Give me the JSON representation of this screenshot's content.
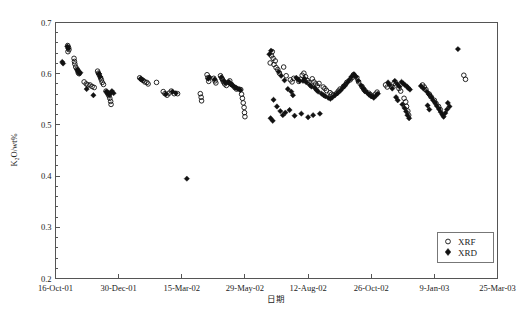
{
  "chart_data": {
    "type": "scatter",
    "title": "",
    "xlabel": "日期",
    "ylabel": "K₂O/wt%",
    "ylim": [
      0.2,
      0.7
    ],
    "yticks": [
      0.2,
      0.3,
      0.4,
      0.5,
      0.6,
      0.7
    ],
    "ytick_labels": [
      "0.2",
      "0.3",
      "0.4",
      "0.5",
      "0.6",
      "0.7"
    ],
    "y_minor_tick_step": 0.02,
    "xlim": [
      0,
      525
    ],
    "xtick_positions": [
      0,
      75,
      150,
      225,
      300,
      375,
      450,
      525
    ],
    "xtick_labels": [
      "16-Oct-01",
      "30-Dec-01",
      "15-Mar-02",
      "29-May-02",
      "12-Aug-02",
      "26-Oct-02",
      "9-Jan-03",
      "25-Mar-03"
    ],
    "grid": false,
    "legend_position": "lower-right",
    "marker_colors": {
      "xrf": "#111111",
      "xrd": "#111111"
    },
    "series": [
      {
        "name": "XRF",
        "marker": "open-circle",
        "points": [
          [
            14.5,
            0.655
          ],
          [
            15.5,
            0.651
          ],
          [
            16.0,
            0.647
          ],
          [
            14.8,
            0.643
          ],
          [
            22.0,
            0.63
          ],
          [
            22.5,
            0.624
          ],
          [
            23.0,
            0.619
          ],
          [
            24.0,
            0.613
          ],
          [
            25.5,
            0.609
          ],
          [
            26.5,
            0.606
          ],
          [
            27.0,
            0.602
          ],
          [
            28.0,
            0.6
          ],
          [
            34.0,
            0.584
          ],
          [
            36.5,
            0.58
          ],
          [
            38.5,
            0.578
          ],
          [
            41.0,
            0.578
          ],
          [
            43.5,
            0.575
          ],
          [
            46.0,
            0.573
          ],
          [
            50.0,
            0.605
          ],
          [
            51.0,
            0.601
          ],
          [
            52.0,
            0.598
          ],
          [
            53.5,
            0.592
          ],
          [
            54.5,
            0.588
          ],
          [
            55.5,
            0.583
          ],
          [
            57.0,
            0.579
          ],
          [
            60.0,
            0.566
          ],
          [
            61.5,
            0.563
          ],
          [
            62.5,
            0.56
          ],
          [
            63.5,
            0.557
          ],
          [
            64.5,
            0.552
          ],
          [
            65.5,
            0.546
          ],
          [
            66.0,
            0.54
          ],
          [
            100.0,
            0.592
          ],
          [
            102.0,
            0.589
          ],
          [
            104.0,
            0.587
          ],
          [
            106.0,
            0.584
          ],
          [
            108.5,
            0.583
          ],
          [
            110.0,
            0.58
          ],
          [
            120.0,
            0.583
          ],
          [
            128.0,
            0.565
          ],
          [
            130.0,
            0.561
          ],
          [
            132.5,
            0.558
          ],
          [
            135.0,
            0.562
          ],
          [
            137.5,
            0.566
          ],
          [
            141.0,
            0.561
          ],
          [
            145.0,
            0.561
          ],
          [
            172.0,
            0.561
          ],
          [
            173.0,
            0.554
          ],
          [
            173.5,
            0.547
          ],
          [
            180.0,
            0.598
          ],
          [
            181.0,
            0.592
          ],
          [
            182.0,
            0.585
          ],
          [
            188.0,
            0.591
          ],
          [
            189.5,
            0.586
          ],
          [
            190.5,
            0.582
          ],
          [
            196.0,
            0.596
          ],
          [
            197.5,
            0.591
          ],
          [
            198.5,
            0.588
          ],
          [
            199.5,
            0.584
          ],
          [
            201.0,
            0.58
          ],
          [
            203.0,
            0.577
          ],
          [
            205.0,
            0.583
          ],
          [
            207.0,
            0.586
          ],
          [
            209.0,
            0.579
          ],
          [
            213.0,
            0.573
          ],
          [
            215.0,
            0.57
          ],
          [
            220.0,
            0.569
          ],
          [
            221.0,
            0.56
          ],
          [
            222.0,
            0.552
          ],
          [
            223.0,
            0.543
          ],
          [
            224.0,
            0.534
          ],
          [
            224.5,
            0.524
          ],
          [
            225.0,
            0.516
          ],
          [
            255.0,
            0.621
          ],
          [
            256.5,
            0.635
          ],
          [
            257.5,
            0.643
          ],
          [
            258.5,
            0.63
          ],
          [
            259.5,
            0.618
          ],
          [
            261.0,
            0.625
          ],
          [
            262.0,
            0.612
          ],
          [
            264.0,
            0.608
          ],
          [
            266.0,
            0.601
          ],
          [
            271.0,
            0.613
          ],
          [
            274.0,
            0.596
          ],
          [
            279.0,
            0.588
          ],
          [
            281.0,
            0.584
          ],
          [
            283.0,
            0.591
          ],
          [
            289.0,
            0.585
          ],
          [
            291.0,
            0.589
          ],
          [
            293.0,
            0.597
          ],
          [
            295.0,
            0.601
          ],
          [
            297.0,
            0.594
          ],
          [
            299.0,
            0.587
          ],
          [
            301.0,
            0.583
          ],
          [
            305.0,
            0.59
          ],
          [
            307.0,
            0.584
          ],
          [
            309.0,
            0.58
          ],
          [
            311.0,
            0.576
          ],
          [
            313.0,
            0.581
          ],
          [
            318.0,
            0.574
          ],
          [
            320.0,
            0.571
          ],
          [
            322.0,
            0.567
          ],
          [
            326.0,
            0.563
          ],
          [
            328.0,
            0.56
          ],
          [
            330.0,
            0.558
          ],
          [
            334.0,
            0.562
          ],
          [
            336.0,
            0.566
          ],
          [
            338.0,
            0.57
          ],
          [
            342.0,
            0.575
          ],
          [
            344.0,
            0.578
          ],
          [
            346.0,
            0.583
          ],
          [
            350.0,
            0.588
          ],
          [
            352.0,
            0.592
          ],
          [
            354.0,
            0.598
          ],
          [
            358.0,
            0.592
          ],
          [
            360.0,
            0.584
          ],
          [
            364.0,
            0.575
          ],
          [
            366.0,
            0.57
          ],
          [
            368.0,
            0.566
          ],
          [
            372.0,
            0.562
          ],
          [
            374.0,
            0.559
          ],
          [
            376.0,
            0.556
          ],
          [
            380.0,
            0.56
          ],
          [
            382.0,
            0.564
          ],
          [
            392.0,
            0.578
          ],
          [
            394.0,
            0.574
          ],
          [
            402.0,
            0.581
          ],
          [
            404.0,
            0.578
          ],
          [
            408.0,
            0.571
          ],
          [
            410.0,
            0.566
          ],
          [
            414.0,
            0.552
          ],
          [
            416.0,
            0.545
          ],
          [
            417.0,
            0.536
          ],
          [
            418.5,
            0.527
          ],
          [
            419.5,
            0.519
          ],
          [
            436.0,
            0.578
          ],
          [
            438.0,
            0.574
          ],
          [
            440.0,
            0.569
          ],
          [
            444.0,
            0.56
          ],
          [
            446.0,
            0.555
          ],
          [
            450.0,
            0.548
          ],
          [
            452.0,
            0.542
          ],
          [
            455.0,
            0.536
          ],
          [
            457.0,
            0.53
          ],
          [
            485.0,
            0.597
          ],
          [
            487.0,
            0.589
          ]
        ]
      },
      {
        "name": "XRD",
        "marker": "filled-diamond",
        "points": [
          [
            14.0,
            0.653
          ],
          [
            15.0,
            0.649
          ],
          [
            8.0,
            0.623
          ],
          [
            9.0,
            0.62
          ],
          [
            26.0,
            0.608
          ],
          [
            27.5,
            0.604
          ],
          [
            28.5,
            0.601
          ],
          [
            29.5,
            0.602
          ],
          [
            37.0,
            0.57
          ],
          [
            51.5,
            0.6
          ],
          [
            53.0,
            0.594
          ],
          [
            60.5,
            0.565
          ],
          [
            62.0,
            0.562
          ],
          [
            64.0,
            0.559
          ],
          [
            65.0,
            0.562
          ],
          [
            67.0,
            0.566
          ],
          [
            69.0,
            0.562
          ],
          [
            45.0,
            0.558
          ],
          [
            101.0,
            0.59
          ],
          [
            103.0,
            0.588
          ],
          [
            131.0,
            0.56
          ],
          [
            139.0,
            0.565
          ],
          [
            143.0,
            0.562
          ],
          [
            156.0,
            0.395
          ],
          [
            181.5,
            0.59
          ],
          [
            183.0,
            0.593
          ],
          [
            189.0,
            0.589
          ],
          [
            197.0,
            0.593
          ],
          [
            200.0,
            0.586
          ],
          [
            202.0,
            0.582
          ],
          [
            206.0,
            0.584
          ],
          [
            208.0,
            0.58
          ],
          [
            210.0,
            0.577
          ],
          [
            212.0,
            0.575
          ],
          [
            214.0,
            0.573
          ],
          [
            216.0,
            0.571
          ],
          [
            218.0,
            0.57
          ],
          [
            219.5,
            0.568
          ],
          [
            254.0,
            0.638
          ],
          [
            256.0,
            0.645
          ],
          [
            265.0,
            0.604
          ],
          [
            268.0,
            0.596
          ],
          [
            272.0,
            0.587
          ],
          [
            276.0,
            0.57
          ],
          [
            280.0,
            0.565
          ],
          [
            282.0,
            0.558
          ],
          [
            286.0,
            0.592
          ],
          [
            288.0,
            0.589
          ],
          [
            290.0,
            0.586
          ],
          [
            294.0,
            0.586
          ],
          [
            296.0,
            0.59
          ],
          [
            298.0,
            0.583
          ],
          [
            302.0,
            0.578
          ],
          [
            304.0,
            0.575
          ],
          [
            308.0,
            0.572
          ],
          [
            310.0,
            0.568
          ],
          [
            312.0,
            0.565
          ],
          [
            316.0,
            0.561
          ],
          [
            318.5,
            0.558
          ],
          [
            320.5,
            0.556
          ],
          [
            324.0,
            0.553
          ],
          [
            326.5,
            0.551
          ],
          [
            329.0,
            0.554
          ],
          [
            332.0,
            0.558
          ],
          [
            335.0,
            0.562
          ],
          [
            338.5,
            0.567
          ],
          [
            341.0,
            0.572
          ],
          [
            343.5,
            0.577
          ],
          [
            346.5,
            0.583
          ],
          [
            349.0,
            0.588
          ],
          [
            351.5,
            0.594
          ],
          [
            354.5,
            0.599
          ],
          [
            357.0,
            0.594
          ],
          [
            359.5,
            0.586
          ],
          [
            363.0,
            0.577
          ],
          [
            365.5,
            0.571
          ],
          [
            367.5,
            0.566
          ],
          [
            370.0,
            0.563
          ],
          [
            372.5,
            0.559
          ],
          [
            375.0,
            0.556
          ],
          [
            378.0,
            0.553
          ],
          [
            380.5,
            0.557
          ],
          [
            383.0,
            0.561
          ],
          [
            259.0,
            0.549
          ],
          [
            263.0,
            0.536
          ],
          [
            267.0,
            0.527
          ],
          [
            270.0,
            0.519
          ],
          [
            273.0,
            0.524
          ],
          [
            278.0,
            0.529
          ],
          [
            284.0,
            0.518
          ],
          [
            292.0,
            0.522
          ],
          [
            300.0,
            0.515
          ],
          [
            306.0,
            0.519
          ],
          [
            314.0,
            0.522
          ],
          [
            255.5,
            0.513
          ],
          [
            258.0,
            0.508
          ],
          [
            395.0,
            0.583
          ],
          [
            397.0,
            0.578
          ],
          [
            400.0,
            0.571
          ],
          [
            403.0,
            0.586
          ],
          [
            406.0,
            0.58
          ],
          [
            408.5,
            0.575
          ],
          [
            411.0,
            0.584
          ],
          [
            413.0,
            0.581
          ],
          [
            415.0,
            0.578
          ],
          [
            417.5,
            0.575
          ],
          [
            419.0,
            0.572
          ],
          [
            421.0,
            0.569
          ],
          [
            404.5,
            0.554
          ],
          [
            406.5,
            0.548
          ],
          [
            412.0,
            0.54
          ],
          [
            414.5,
            0.533
          ],
          [
            416.5,
            0.526
          ],
          [
            418.0,
            0.519
          ],
          [
            420.0,
            0.513
          ],
          [
            434.0,
            0.576
          ],
          [
            437.0,
            0.571
          ],
          [
            441.0,
            0.565
          ],
          [
            443.5,
            0.56
          ],
          [
            446.5,
            0.554
          ],
          [
            448.5,
            0.548
          ],
          [
            451.0,
            0.543
          ],
          [
            453.0,
            0.537
          ],
          [
            455.5,
            0.531
          ],
          [
            457.5,
            0.525
          ],
          [
            459.5,
            0.52
          ],
          [
            461.0,
            0.516
          ],
          [
            463.0,
            0.523
          ],
          [
            465.0,
            0.53
          ],
          [
            442.0,
            0.538
          ],
          [
            444.0,
            0.53
          ],
          [
            466.0,
            0.543
          ],
          [
            468.0,
            0.536
          ],
          [
            478.0,
            0.648
          ]
        ]
      }
    ]
  },
  "legend": {
    "items": [
      {
        "label": "XRF",
        "marker": "open-circle"
      },
      {
        "label": "XRD",
        "marker": "filled-diamond"
      }
    ]
  }
}
